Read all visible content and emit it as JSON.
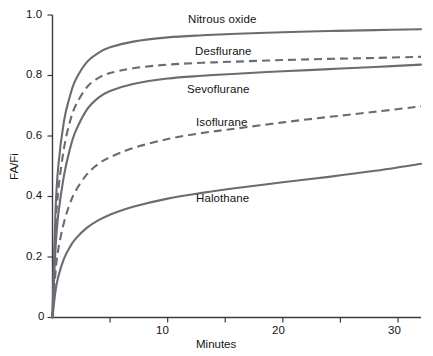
{
  "chart_data": {
    "type": "line",
    "title": "",
    "xlabel": "Minutes",
    "ylabel": "FA/Fi",
    "xlim": [
      0,
      32
    ],
    "ylim": [
      0,
      1.0
    ],
    "grid": false,
    "legend_position": "inline-labels",
    "x_ticks": [
      0,
      5,
      10,
      15,
      20,
      25,
      30
    ],
    "x_tick_labels": [
      "0",
      "",
      "10",
      "",
      "20",
      "",
      "30"
    ],
    "y_ticks": [
      0,
      0.2,
      0.4,
      0.6,
      0.8,
      1.0
    ],
    "y_tick_labels": [
      "0",
      "0.2",
      "0.4",
      "0.6",
      "0.8",
      "1.0"
    ],
    "x": [
      0,
      0.25,
      0.5,
      1,
      1.5,
      2,
      3,
      4,
      5,
      7,
      10,
      13,
      16,
      20,
      24,
      28,
      32
    ],
    "series": [
      {
        "name": "Nitrous oxide",
        "style": "solid",
        "color": "#6b6b73",
        "values": [
          0,
          0.34,
          0.5,
          0.65,
          0.73,
          0.785,
          0.845,
          0.875,
          0.893,
          0.912,
          0.926,
          0.933,
          0.938,
          0.943,
          0.947,
          0.95,
          0.953
        ]
      },
      {
        "name": "Desflurane",
        "style": "dashed",
        "color": "#6b6b73",
        "values": [
          0,
          0.28,
          0.42,
          0.56,
          0.645,
          0.7,
          0.762,
          0.792,
          0.808,
          0.824,
          0.836,
          0.842,
          0.846,
          0.851,
          0.855,
          0.858,
          0.862
        ]
      },
      {
        "name": "Sevoflurane",
        "style": "solid",
        "color": "#6b6b73",
        "values": [
          0,
          0.22,
          0.34,
          0.47,
          0.555,
          0.615,
          0.688,
          0.727,
          0.749,
          0.772,
          0.79,
          0.799,
          0.806,
          0.814,
          0.821,
          0.828,
          0.836
        ]
      },
      {
        "name": "Isoflurane",
        "style": "dashed",
        "color": "#6b6b73",
        "values": [
          0,
          0.145,
          0.225,
          0.315,
          0.375,
          0.418,
          0.474,
          0.508,
          0.53,
          0.56,
          0.59,
          0.61,
          0.625,
          0.645,
          0.663,
          0.68,
          0.698
        ]
      },
      {
        "name": "Halothane",
        "style": "solid",
        "color": "#6b6b73",
        "values": [
          0,
          0.085,
          0.135,
          0.195,
          0.232,
          0.26,
          0.297,
          0.322,
          0.34,
          0.366,
          0.393,
          0.412,
          0.428,
          0.447,
          0.465,
          0.485,
          0.508
        ]
      }
    ],
    "annotations": [
      {
        "text": "Nitrous oxide",
        "x_px": 188,
        "y_px": 13
      },
      {
        "text": "Desflurane",
        "x_px": 195,
        "y_px": 45
      },
      {
        "text": "Sevoflurane",
        "x_px": 187,
        "y_px": 83
      },
      {
        "text": "Isoflurane",
        "x_px": 196,
        "y_px": 116
      },
      {
        "text": "Halothane",
        "x_px": 196,
        "y_px": 192
      }
    ]
  }
}
